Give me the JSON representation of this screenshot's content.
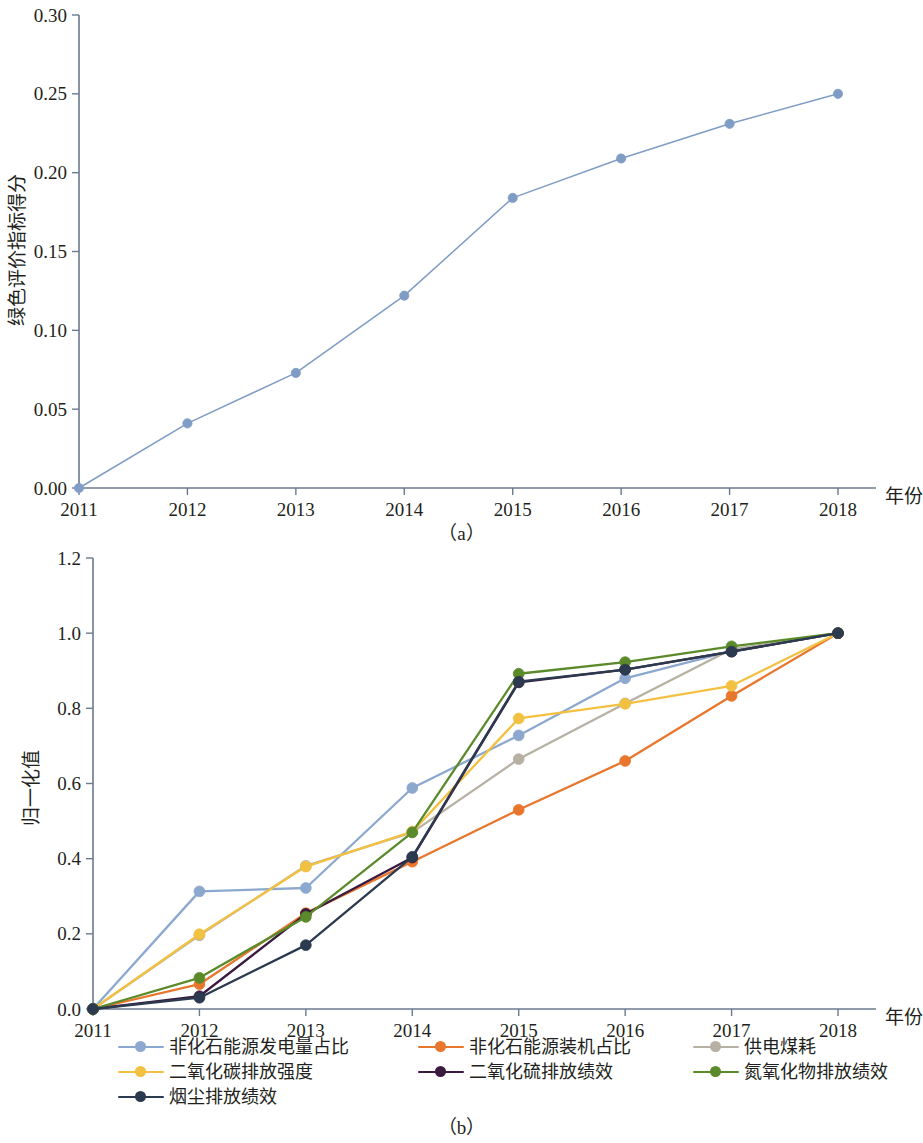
{
  "figure": {
    "panel_a_caption": "（a）",
    "panel_b_caption": "（b）"
  },
  "panel_a": {
    "x_axis_name": "年份",
    "y_axis_name": "绿色评价指标得分",
    "x_tick_labels": [
      "2011",
      "2012",
      "2013",
      "2014",
      "2015",
      "2016",
      "2017",
      "2018"
    ],
    "y_tick_labels": [
      "0.00",
      "0.05",
      "0.10",
      "0.15",
      "0.20",
      "0.25",
      "0.30"
    ],
    "series_name": "绿色评价指标得分",
    "series_color": "#7f9cc4"
  },
  "panel_b": {
    "x_axis_name": "年份",
    "y_axis_name": "归一化值",
    "x_tick_labels": [
      "2011",
      "2012",
      "2013",
      "2014",
      "2015",
      "2016",
      "2017",
      "2018"
    ],
    "y_tick_labels": [
      "0.0",
      "0.2",
      "0.4",
      "0.6",
      "0.8",
      "1.0",
      "1.2"
    ],
    "legend": [
      {
        "label": "非化石能源发电量占比",
        "color": "#8ca8ce"
      },
      {
        "label": "非化石能源装机占比",
        "color": "#e8762c"
      },
      {
        "label": "供电煤耗",
        "color": "#b7b1a4"
      },
      {
        "label": "二氧化碳排放强度",
        "color": "#f2c141"
      },
      {
        "label": "二氧化硫排放绩效",
        "color": "#3b1a40"
      },
      {
        "label": "氮氧化物排放绩效",
        "color": "#5b8a2b"
      },
      {
        "label": "烟尘排放绩效",
        "color": "#2b3a4f"
      }
    ]
  },
  "chart_data": [
    {
      "type": "line",
      "panel": "(a)",
      "title": "",
      "xlabel": "年份",
      "ylabel": "绿色评价指标得分",
      "x": [
        2011,
        2012,
        2013,
        2014,
        2015,
        2016,
        2017,
        2018
      ],
      "categories": [
        "2011",
        "2012",
        "2013",
        "2014",
        "2015",
        "2016",
        "2017",
        "2018"
      ],
      "values": [
        0.0,
        0.041,
        0.073,
        0.122,
        0.184,
        0.209,
        0.231,
        0.25
      ],
      "series": [
        {
          "name": "绿色评价指标得分",
          "color": "#7f9cc4",
          "values": [
            0.0,
            0.041,
            0.073,
            0.122,
            0.184,
            0.209,
            0.231,
            0.25
          ]
        }
      ],
      "ylim": [
        0.0,
        0.3
      ],
      "yticks": [
        0.0,
        0.05,
        0.1,
        0.15,
        0.2,
        0.25,
        0.3
      ],
      "grid": false,
      "legend_position": "none"
    },
    {
      "type": "line",
      "panel": "(b)",
      "title": "",
      "xlabel": "年份",
      "ylabel": "归一化值",
      "x": [
        2011,
        2012,
        2013,
        2014,
        2015,
        2016,
        2017,
        2018
      ],
      "categories": [
        "2011",
        "2012",
        "2013",
        "2014",
        "2015",
        "2016",
        "2017",
        "2018"
      ],
      "series": [
        {
          "name": "非化石能源发电量占比",
          "color": "#8ca8ce",
          "values": [
            0.0,
            0.313,
            0.322,
            0.588,
            0.728,
            0.88,
            0.952,
            1.0
          ]
        },
        {
          "name": "非化石能源装机占比",
          "color": "#e8762c",
          "values": [
            0.0,
            0.066,
            0.255,
            0.392,
            0.53,
            0.66,
            0.833,
            1.0
          ]
        },
        {
          "name": "供电煤耗",
          "color": "#b7b1a4",
          "values": [
            0.0,
            0.196,
            0.381,
            0.47,
            0.665,
            0.813,
            0.957,
            1.0
          ]
        },
        {
          "name": "二氧化碳排放强度",
          "color": "#f2c141",
          "values": [
            0.0,
            0.199,
            0.379,
            0.472,
            0.773,
            0.812,
            0.86,
            1.0
          ]
        },
        {
          "name": "二氧化硫排放绩效",
          "color": "#3b1a40",
          "values": [
            0.0,
            0.034,
            0.253,
            0.403,
            0.869,
            0.903,
            0.951,
            1.0
          ]
        },
        {
          "name": "氮氧化物排放绩效",
          "color": "#5b8a2b",
          "values": [
            0.0,
            0.083,
            0.245,
            0.47,
            0.892,
            0.923,
            0.965,
            1.0
          ]
        },
        {
          "name": "烟尘排放绩效",
          "color": "#2b3a4f",
          "values": [
            0.0,
            0.03,
            0.17,
            0.405,
            0.871,
            0.903,
            0.951,
            1.0
          ]
        }
      ],
      "ylim": [
        0.0,
        1.2
      ],
      "yticks": [
        0.0,
        0.2,
        0.4,
        0.6,
        0.8,
        1.0,
        1.2
      ],
      "grid": false,
      "legend_position": "bottom"
    }
  ]
}
